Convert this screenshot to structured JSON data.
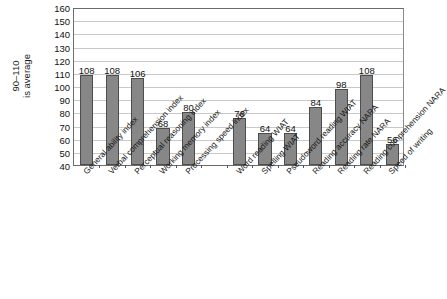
{
  "chart_data": {
    "type": "bar",
    "title": "",
    "xlabel": "",
    "ylabel": "90–110 is average",
    "ylabel_lines": [
      "90–110",
      "is average"
    ],
    "ylim": [
      40,
      160
    ],
    "ytick_step": 10,
    "yticks": [
      160,
      150,
      140,
      130,
      120,
      110,
      100,
      90,
      80,
      70,
      60,
      50,
      40
    ],
    "grid": true,
    "legend": "none",
    "bar_color": "#878787",
    "bar_edge_color": "#4d4d4d",
    "categories": [
      "General ability index",
      "Verbal comprehension index",
      "Perceptual reasoning index",
      "Working memory index",
      "Processing speed index",
      "",
      "Word reading WIAT",
      "Spelling WIAT",
      "Pseudoword reading WIAT",
      "Reading accuracy NARA",
      "Reading rate NARA",
      "Reading comprehension NARA",
      "Speed of writing"
    ],
    "values": [
      108,
      108,
      106,
      68,
      80,
      null,
      76,
      64,
      64,
      84,
      98,
      108,
      56
    ],
    "value_labels": [
      "108",
      "108",
      "106",
      "68",
      "80",
      "",
      "76",
      "64",
      "64",
      "84",
      "98",
      "108",
      "56"
    ]
  },
  "caption": {
    "text": ""
  }
}
